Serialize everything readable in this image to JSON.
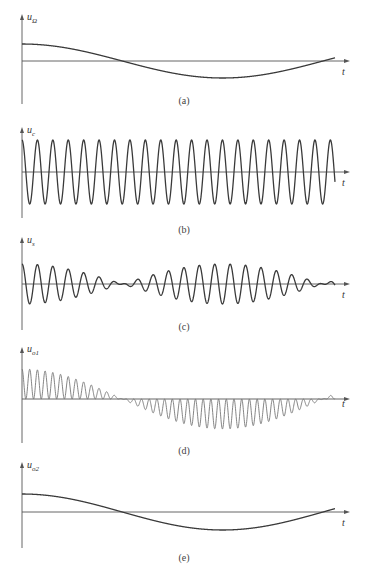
{
  "chart_data": {
    "type": "line",
    "panels": [
      {
        "id": "a",
        "caption": "(a)",
        "ylabel_main": "u",
        "ylabel_sub": "Ω",
        "xlabel": "t",
        "signal": "modulating",
        "description": "Low-frequency cosine, ~0.8 cycles, starts at max",
        "y_axis_x": 22,
        "baseline_y": 61,
        "axis_top": 14,
        "axis_bottom": 104,
        "x_end": 335,
        "amp": 17,
        "cycles": 0.78
      },
      {
        "id": "b",
        "caption": "(b)",
        "ylabel_main": "u",
        "ylabel_sub": "c",
        "xlabel": "t",
        "signal": "carrier",
        "description": "High-frequency carrier cosine, ~20 cycles, constant amplitude",
        "y_axis_x": 22,
        "baseline_y": 172,
        "axis_top": 127,
        "axis_bottom": 218,
        "x_end": 335,
        "amp": 32,
        "cycles": 20.3
      },
      {
        "id": "c",
        "caption": "(c)",
        "ylabel_main": "u",
        "ylabel_sub": "s",
        "xlabel": "t",
        "signal": "DSB",
        "description": "Double-sideband signal: carrier multiplied by modulating cosine (phase reversal at zeros)",
        "y_axis_x": 22,
        "baseline_y": 284,
        "axis_top": 237,
        "axis_bottom": 330,
        "x_end": 335,
        "amp": 20,
        "cycles": 20.3,
        "mod_cycles": 1.5
      },
      {
        "id": "d",
        "caption": "(d)",
        "ylabel_main": "u",
        "ylabel_sub": "o1",
        "xlabel": "t",
        "signal": "multiplier output",
        "description": "Product u_s·u_r: twice-carrier-frequency pulses whose envelope follows the modulating signal",
        "y_axis_x": 22,
        "baseline_y": 399,
        "axis_top": 347,
        "axis_bottom": 443,
        "x_end": 335,
        "amp": 30,
        "cycles": 40.6,
        "mod_cycles": 0.78
      },
      {
        "id": "e",
        "caption": "(e)",
        "ylabel_main": "u",
        "ylabel_sub": "o2",
        "xlabel": "t",
        "signal": "demodulated output",
        "description": "Low-pass filtered output reproducing the modulating signal",
        "y_axis_x": 22,
        "baseline_y": 512,
        "axis_top": 462,
        "axis_bottom": 548,
        "x_end": 335,
        "amp": 18,
        "cycles": 0.78
      }
    ],
    "x_axis_end": 350,
    "grid": false,
    "legend": "none"
  },
  "captions": {
    "a": "(a)",
    "b": "(b)",
    "c": "(c)",
    "d": "(d)",
    "e": "(e)"
  },
  "labels": {
    "a": {
      "main": "u",
      "sub": "Ω"
    },
    "b": {
      "main": "u",
      "sub": "c"
    },
    "c": {
      "main": "u",
      "sub": "s"
    },
    "d": {
      "main": "u",
      "sub": "o1"
    },
    "e": {
      "main": "u",
      "sub": "o2"
    },
    "t": "t"
  },
  "colors": {
    "axis": "#555555",
    "wave": "#3a3a3a",
    "wave_light": "#777777"
  }
}
